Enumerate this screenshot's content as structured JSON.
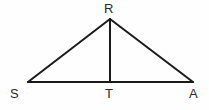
{
  "figure": {
    "type": "geometry-diagram",
    "shape": "triangle-with-altitude",
    "background_color": "#fefefe",
    "stroke_color": "#1a1a1a",
    "stroke_width": 2,
    "label_color": "#2a2a2a",
    "canvas": {
      "width": 209,
      "height": 110
    },
    "points": [
      {
        "id": "R",
        "label": "R",
        "x": 110,
        "y": 19,
        "role": "apex"
      },
      {
        "id": "S",
        "label": "S",
        "x": 28,
        "y": 82,
        "role": "base-left-vertex"
      },
      {
        "id": "T",
        "label": "T",
        "x": 110,
        "y": 82,
        "role": "altitude-foot"
      },
      {
        "id": "A",
        "label": "A",
        "x": 193,
        "y": 82,
        "role": "base-right-vertex"
      }
    ],
    "segments": [
      {
        "id": "SR",
        "from": "S",
        "to": "R",
        "name": "left-side"
      },
      {
        "id": "RA",
        "from": "R",
        "to": "A",
        "name": "right-side"
      },
      {
        "id": "SA",
        "from": "S",
        "to": "A",
        "name": "base"
      },
      {
        "id": "RT",
        "from": "R",
        "to": "T",
        "name": "altitude"
      }
    ]
  }
}
